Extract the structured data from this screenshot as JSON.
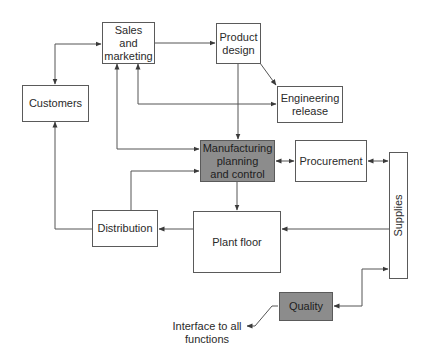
{
  "diagram": {
    "nodes": {
      "sales": {
        "label": "Sales\nand\nmarketing"
      },
      "product_design": {
        "label": "Product\ndesign"
      },
      "customers": {
        "label": "Customers"
      },
      "engineering": {
        "label": "Engineering\nrelease"
      },
      "mpc": {
        "label": "Manufacturing\nplanning\nand control",
        "fill": "#8c8c8c"
      },
      "procurement": {
        "label": "Procurement"
      },
      "supplies": {
        "label": "Supplies"
      },
      "distribution": {
        "label": "Distribution"
      },
      "plant_floor": {
        "label": "Plant floor"
      },
      "quality": {
        "label": "Quality",
        "fill": "#8c8c8c"
      }
    },
    "annotations": {
      "interface": "Interface to all\nfunctions"
    },
    "edges": [
      {
        "from": "customers",
        "to": "sales",
        "type": "bidirectional"
      },
      {
        "from": "sales",
        "to": "product_design",
        "type": "directed"
      },
      {
        "from": "product_design",
        "to": "engineering",
        "type": "directed"
      },
      {
        "from": "product_design",
        "to": "mpc",
        "type": "directed"
      },
      {
        "from": "engineering",
        "to": "sales",
        "type": "bidirectional"
      },
      {
        "from": "sales",
        "to": "mpc",
        "type": "bidirectional"
      },
      {
        "from": "mpc",
        "to": "procurement",
        "type": "bidirectional"
      },
      {
        "from": "procurement",
        "to": "supplies",
        "type": "bidirectional"
      },
      {
        "from": "mpc",
        "to": "plant_floor",
        "type": "directed"
      },
      {
        "from": "supplies",
        "to": "plant_floor",
        "type": "directed"
      },
      {
        "from": "plant_floor",
        "to": "distribution",
        "type": "directed"
      },
      {
        "from": "distribution",
        "to": "mpc",
        "type": "directed"
      },
      {
        "from": "distribution",
        "to": "customers",
        "type": "directed"
      },
      {
        "from": "supplies",
        "to": "quality",
        "type": "bidirectional"
      },
      {
        "from": "quality",
        "to": "interface",
        "type": "directed"
      }
    ]
  }
}
